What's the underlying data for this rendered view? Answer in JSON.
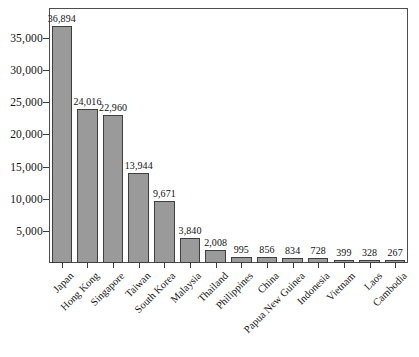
{
  "chart_data": {
    "type": "bar",
    "title": "",
    "subtitle": "",
    "xlabel": "",
    "ylabel": "",
    "categories": [
      "Japan",
      "Hong Kong",
      "Singapore",
      "Taiwan",
      "South Korea",
      "Malaysia",
      "Thailand",
      "Philippines",
      "China",
      "Papua New Guinea",
      "Indonesia",
      "Vietnam",
      "Laos",
      "Cambodia"
    ],
    "values": [
      36894,
      24016,
      22960,
      13944,
      9671,
      3840,
      2008,
      995,
      856,
      834,
      728,
      399,
      328,
      267
    ],
    "value_labels": [
      "36,894",
      "24,016",
      "22,960",
      "13,944",
      "9,671",
      "3,840",
      "2,008",
      "995",
      "856",
      "834",
      "728",
      "399",
      "328",
      "267"
    ],
    "ylim": [
      0,
      39500
    ],
    "yticks": [
      5000,
      10000,
      15000,
      20000,
      25000,
      30000,
      35000
    ],
    "ytick_labels": [
      "5,000",
      "10,000",
      "15,000",
      "20,000",
      "25,000",
      "30,000",
      "35,000"
    ],
    "grid": false,
    "legend": null,
    "bar_color": "#9a9a9a",
    "bar_edge_color": "#3f3f3f",
    "frame_color": "#4d4d4d",
    "background_color": "#ffffff",
    "xtick_label_rotation": -45
  }
}
